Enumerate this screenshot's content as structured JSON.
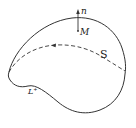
{
  "diagram": {
    "surface_label": "S",
    "point_label": "M",
    "normal_label": "n",
    "boundary_label": "L⁺",
    "colors": {
      "stroke": "#333333",
      "background": "#ffffff"
    }
  }
}
